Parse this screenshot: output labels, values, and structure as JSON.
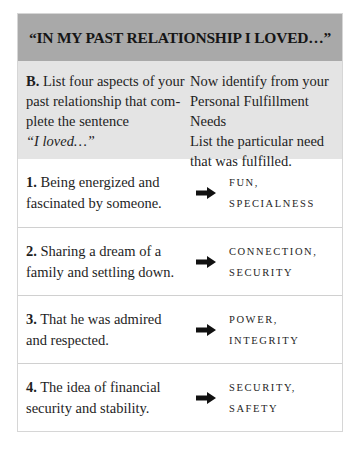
{
  "title": "“IN MY PAST RELATIONSHIP I LOVED…”",
  "instructions": {
    "left": {
      "label": "B.",
      "line1": " List four aspects of your",
      "line2": "past relationship that com-",
      "line3": "plete the sentence",
      "quote": "“I loved…”"
    },
    "right": {
      "line1": "Now identify from your",
      "line2": "Personal Fulfillment Needs",
      "line3": "List the particular need",
      "line4": "that was fulfilled."
    }
  },
  "rows": [
    {
      "number": "1.",
      "line1": " Being energized and",
      "line2": "fascinated by someone.",
      "arrow_icon": "right-arrow-icon",
      "need_line1": "Fun, Specialness",
      "need_line2": ""
    },
    {
      "number": "2.",
      "line1": " Sharing a dream of a",
      "line2": "family and settling down.",
      "arrow_icon": "right-arrow-icon",
      "need_line1": "Connection,",
      "need_line2": "Security"
    },
    {
      "number": "3.",
      "line1": " That he was admired",
      "line2": "and respected.",
      "arrow_icon": "right-arrow-icon",
      "need_line1": "Power,",
      "need_line2": "Integrity"
    },
    {
      "number": "4.",
      "line1": " The idea of financial",
      "line2": "security and stability.",
      "arrow_icon": "right-arrow-icon",
      "need_line1": "Security, Safety",
      "need_line2": ""
    }
  ],
  "colors": {
    "title_bg": "#a9a9a9",
    "instructions_bg": "#e4e4e4",
    "row_bg": "#ffffff",
    "border": "#d0d0d0",
    "text": "#1e1e1e"
  }
}
